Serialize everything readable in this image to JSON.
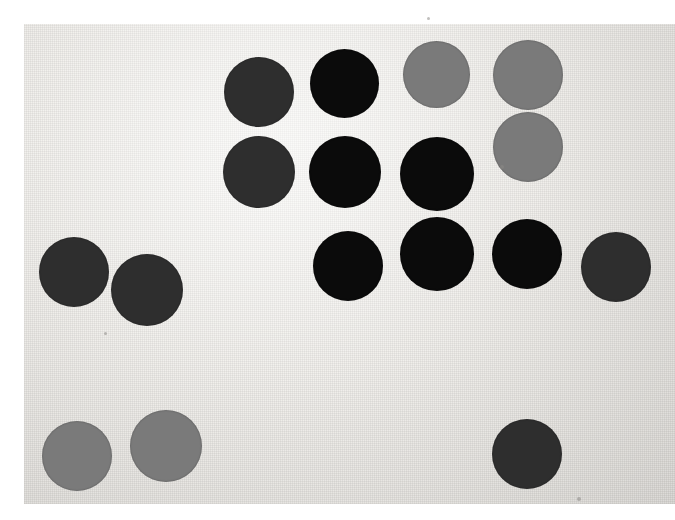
{
  "scene": {
    "title": "Photograph of colored paper discs on textured card",
    "width": 675,
    "height": 520,
    "background_color": "#ffffff"
  },
  "paper": {
    "name": "textured-card-sheet",
    "x": 24,
    "y": 24,
    "width": 651,
    "height": 480,
    "base_color": "#eeeeec",
    "highlight_color": "#f4f3f0",
    "shadow_color": "#e2e0dc"
  },
  "palette": {
    "black": "#0b0b0b",
    "dark_gray": "#2e2e2e",
    "medium_gray": "#7a7a7a"
  },
  "legend": [
    {
      "label": "black",
      "color": "#0b0b0b",
      "count": 7
    },
    {
      "label": "dark gray",
      "color": "#2e2e2e",
      "count": 7
    },
    {
      "label": "medium gray",
      "color": "#7a7a7a",
      "count": 5
    }
  ],
  "counts": {
    "total_discs": 19,
    "black": 7,
    "dark_gray": 7,
    "medium_gray": 5
  },
  "discs": [
    {
      "id": "disc-dark-col1-top",
      "shade": "dark_gray",
      "color": "#2e2e2e",
      "cx": 259,
      "cy": 92,
      "d": 70
    },
    {
      "id": "disc-dark-col1-bottom",
      "shade": "dark_gray",
      "color": "#2e2e2e",
      "cx": 259,
      "cy": 172,
      "d": 72
    },
    {
      "id": "disc-black-row1-c2",
      "shade": "black",
      "color": "#0b0b0b",
      "cx": 344,
      "cy": 83,
      "d": 69
    },
    {
      "id": "disc-gray-row1-c3",
      "shade": "medium_gray",
      "color": "#7a7a7a",
      "cx": 436,
      "cy": 74,
      "d": 67
    },
    {
      "id": "disc-gray-row1-c4",
      "shade": "medium_gray",
      "color": "#7a7a7a",
      "cx": 528,
      "cy": 75,
      "d": 70
    },
    {
      "id": "disc-gray-row2-c4",
      "shade": "medium_gray",
      "color": "#7a7a7a",
      "cx": 528,
      "cy": 147,
      "d": 70
    },
    {
      "id": "disc-black-row2-c2",
      "shade": "black",
      "color": "#0b0b0b",
      "cx": 345,
      "cy": 172,
      "d": 72
    },
    {
      "id": "disc-black-row2-c3",
      "shade": "black",
      "color": "#0b0b0b",
      "cx": 437,
      "cy": 174,
      "d": 74
    },
    {
      "id": "disc-black-row3-c2",
      "shade": "black",
      "color": "#0b0b0b",
      "cx": 348,
      "cy": 266,
      "d": 70
    },
    {
      "id": "disc-black-row3-c3",
      "shade": "black",
      "color": "#0b0b0b",
      "cx": 437,
      "cy": 254,
      "d": 74
    },
    {
      "id": "disc-black-row3-c4",
      "shade": "black",
      "color": "#0b0b0b",
      "cx": 527,
      "cy": 254,
      "d": 70
    },
    {
      "id": "disc-dark-right-edge",
      "shade": "dark_gray",
      "color": "#2e2e2e",
      "cx": 616,
      "cy": 267,
      "d": 70
    },
    {
      "id": "disc-dark-left-upper",
      "shade": "dark_gray",
      "color": "#2e2e2e",
      "cx": 74,
      "cy": 272,
      "d": 70
    },
    {
      "id": "disc-dark-left-lower",
      "shade": "dark_gray",
      "color": "#2e2e2e",
      "cx": 147,
      "cy": 290,
      "d": 72
    },
    {
      "id": "disc-gray-bottom-left",
      "shade": "medium_gray",
      "color": "#7a7a7a",
      "cx": 77,
      "cy": 456,
      "d": 70
    },
    {
      "id": "disc-gray-bottom-mid",
      "shade": "medium_gray",
      "color": "#7a7a7a",
      "cx": 166,
      "cy": 446,
      "d": 72
    },
    {
      "id": "disc-dark-bottom-right",
      "shade": "dark_gray",
      "color": "#2e2e2e",
      "cx": 527,
      "cy": 454,
      "d": 70
    },
    {
      "id": "disc-black-row1-c2b",
      "shade": "black",
      "color": "#0b0b0b",
      "cx": 344,
      "cy": 83,
      "d": 0
    },
    {
      "id": "disc-dark-extra",
      "shade": "dark_gray",
      "color": "#2e2e2e",
      "cx": 259,
      "cy": 92,
      "d": 0
    }
  ],
  "specks": [
    {
      "id": "speck-top-center",
      "x": 427,
      "y": 17,
      "s": 3
    },
    {
      "id": "speck-mid-gray",
      "x": 500,
      "y": 165,
      "s": 4
    },
    {
      "id": "speck-bottom",
      "x": 577,
      "y": 497,
      "s": 4
    },
    {
      "id": "speck-left-low",
      "x": 104,
      "y": 332,
      "s": 3
    }
  ]
}
